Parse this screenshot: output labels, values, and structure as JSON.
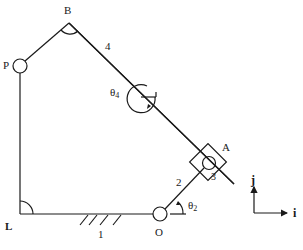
{
  "diagram": {
    "type": "planar-linkage",
    "points": {
      "L": {
        "label": "L"
      },
      "P": {
        "label": "P"
      },
      "B": {
        "label": "B"
      },
      "A": {
        "label": "A"
      },
      "O": {
        "label": "O"
      }
    },
    "links": {
      "ground": {
        "label": "1"
      },
      "crank": {
        "label": "2"
      },
      "slider": {
        "label": "3"
      },
      "rocker": {
        "label": "4"
      }
    },
    "angles": {
      "theta2": {
        "label": "θ",
        "sub": "2"
      },
      "theta4": {
        "label": "θ",
        "sub": "4"
      }
    },
    "axes": {
      "x_label": "i",
      "y_label": "j"
    },
    "colors": {
      "line": "#1a1a1a",
      "background": "#ffffff"
    }
  }
}
